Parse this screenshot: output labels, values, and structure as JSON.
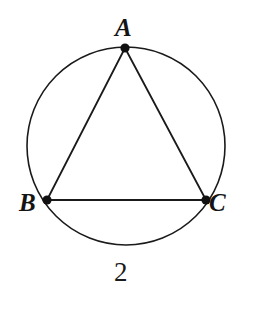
{
  "figure": {
    "kind": "inscribed-triangle-in-circle",
    "title": "",
    "background_color": "#ffffff",
    "stroke_color": "#1a1a1a",
    "vertex_dot_color": "#111111",
    "circle": {
      "center_x": 126,
      "center_y": 146,
      "radius": 99,
      "stroke_width": 1.6
    },
    "vertices": [
      {
        "id": "A",
        "label": "A",
        "x": 125,
        "y": 48,
        "dot_radius": 4.6,
        "label_x": 115,
        "label_y": 15
      },
      {
        "id": "B",
        "label": "B",
        "x": 47,
        "y": 200,
        "dot_radius": 4.6,
        "label_x": 19,
        "label_y": 190
      },
      {
        "id": "C",
        "label": "C",
        "x": 206,
        "y": 200,
        "dot_radius": 4.6,
        "label_x": 209,
        "label_y": 190
      }
    ],
    "edges": [
      {
        "id": "AB",
        "from": "A",
        "to": "B",
        "stroke_width": 1.8
      },
      {
        "id": "AC",
        "from": "A",
        "to": "C",
        "stroke_width": 1.8
      },
      {
        "id": "BC",
        "from": "B",
        "to": "C",
        "stroke_width": 1.8
      }
    ],
    "annotations": [
      {
        "id": "arc-length",
        "text": "2",
        "x": 114,
        "y": 259,
        "refers_to": "arc BC (lower arc)"
      }
    ]
  }
}
